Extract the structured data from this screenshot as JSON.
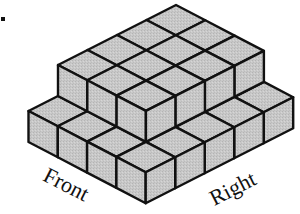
{
  "figure": {
    "type": "isometric-cube-stack",
    "list_marker": ".",
    "labels": {
      "front": "Front",
      "right": "Right"
    },
    "colors": {
      "cube_fill": "#c6c6c6",
      "edge": "#111111",
      "background": "#ffffff"
    },
    "geometry": {
      "origin": [
        176,
        5
      ],
      "left_step": [
        -29.5,
        15
      ],
      "right_step": [
        29.3,
        15.3
      ],
      "cube_height": 31,
      "stroke_width": 2.4
    },
    "tiers": [
      {
        "name": "lower",
        "level": 0,
        "depth": 5,
        "width": 4,
        "offset_left": 0,
        "offset_right": 0
      },
      {
        "name": "upper",
        "level": 1,
        "depth": 4,
        "width": 3,
        "offset_left": 0,
        "offset_right": 0
      }
    ],
    "summary": {
      "lower_tier_cubes": 20,
      "upper_tier_cubes": 12,
      "total_cubes": 32
    }
  }
}
